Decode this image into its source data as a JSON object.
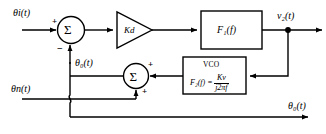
{
  "diagram": {
    "colors": {
      "line": "#000000",
      "background": "#ffffff"
    },
    "signals": {
      "input_phase": "θi(t)",
      "noise_phase": "θn(t)",
      "feedback_phase": "θ₀(t)",
      "output_phase": "θ₀(t)",
      "filter_output": "v₂(t)"
    },
    "blocks": {
      "phase_detector_gain": "Kd",
      "loop_filter": "F₁(f)",
      "vco_title": "VCO",
      "vco_lhs": "F₂(f) =",
      "vco_numerator": "Kv",
      "vco_denominator": "j2πf"
    },
    "summers": {
      "first": {
        "glyph": "Σ",
        "input_sign_left": "+",
        "input_sign_bottom": "−"
      },
      "second": {
        "glyph": "Σ",
        "input_sign_right": "+",
        "input_sign_bottom": "+"
      }
    }
  }
}
